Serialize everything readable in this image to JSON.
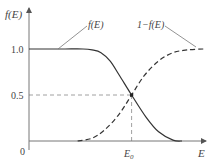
{
  "chart_data": {
    "type": "line",
    "title": "",
    "xlabel": "E",
    "ylabel": "f(E)",
    "ylim": [
      0,
      1.0
    ],
    "xlim": [
      0,
      1
    ],
    "yticks": [
      {
        "value": 0,
        "label": "0"
      },
      {
        "value": 0.5,
        "label": "0.5"
      },
      {
        "value": 1.0,
        "label": "1.0"
      }
    ],
    "xticks": [
      {
        "value": 0.57,
        "label": "E₀"
      }
    ],
    "series": [
      {
        "name": "f(E)",
        "style": "solid",
        "x": [
          0,
          0.1,
          0.2,
          0.3,
          0.35,
          0.4,
          0.45,
          0.5,
          0.57,
          0.65,
          0.72,
          0.8,
          0.85
        ],
        "y": [
          1.0,
          1.0,
          1.0,
          1.0,
          0.99,
          0.96,
          0.87,
          0.72,
          0.5,
          0.26,
          0.1,
          0.01,
          0.0
        ]
      },
      {
        "name": "1-f(E)",
        "style": "dashed",
        "x": [
          0.27,
          0.35,
          0.42,
          0.5,
          0.57,
          0.64,
          0.72,
          0.8,
          0.88,
          0.97
        ],
        "y": [
          0.0,
          0.03,
          0.12,
          0.29,
          0.5,
          0.71,
          0.87,
          0.96,
          0.99,
          1.0
        ]
      }
    ],
    "guides": [
      {
        "type": "hline",
        "y": 0.5,
        "style": "dashed"
      },
      {
        "type": "vline",
        "x": 0.57,
        "style": "dashed"
      }
    ],
    "annotations": [
      {
        "text": "f(E)",
        "points_to": "f(E)"
      },
      {
        "text": "1−f(E)",
        "points_to": "1-f(E)"
      }
    ],
    "grid": false,
    "legend": "none"
  },
  "labels": {
    "ylabel": "f(E)",
    "xlabel": "E",
    "tick_one": "1.0",
    "tick_half": "0.5",
    "tick_zero": "0",
    "tick_e0": "E",
    "tick_e0_sub": "0",
    "anno_f": "f(E)",
    "anno_1f": "1−f(E)"
  }
}
